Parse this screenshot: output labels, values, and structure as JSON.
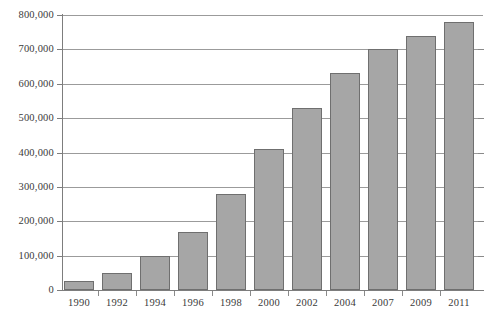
{
  "chart_data": {
    "type": "bar",
    "title": "",
    "subtitle": "",
    "xlabel": "",
    "ylabel": "",
    "categories": [
      "1990",
      "1992",
      "1994",
      "1996",
      "1998",
      "2000",
      "2002",
      "2004",
      "2007",
      "2009",
      "2011"
    ],
    "values": [
      25000,
      50000,
      100000,
      170000,
      280000,
      410000,
      530000,
      630000,
      700000,
      740000,
      780000
    ],
    "series": [
      {
        "name": "",
        "values": [
          25000,
          50000,
          100000,
          170000,
          280000,
          410000,
          530000,
          630000,
          700000,
          740000,
          780000
        ]
      }
    ],
    "ylim": [
      0,
      800000
    ],
    "ytick_values": [
      0,
      100000,
      200000,
      300000,
      400000,
      500000,
      600000,
      700000,
      800000
    ],
    "ytick_labels": [
      "0",
      "100,000",
      "200,000",
      "300,000",
      "400,000",
      "500,000",
      "600,000",
      "700,000",
      "800,000"
    ],
    "grid": true,
    "grid_axis": "y",
    "legend": false,
    "legend_position": "none",
    "annotations": [],
    "bar_fill_color": "#a6a6a6",
    "bar_border_color": "#6f6f6f",
    "gridline_color": "#9b9b9b",
    "axis_color": "#7d7d7d",
    "background_color": "#ffffff",
    "text_color": "#3a3a3a"
  }
}
